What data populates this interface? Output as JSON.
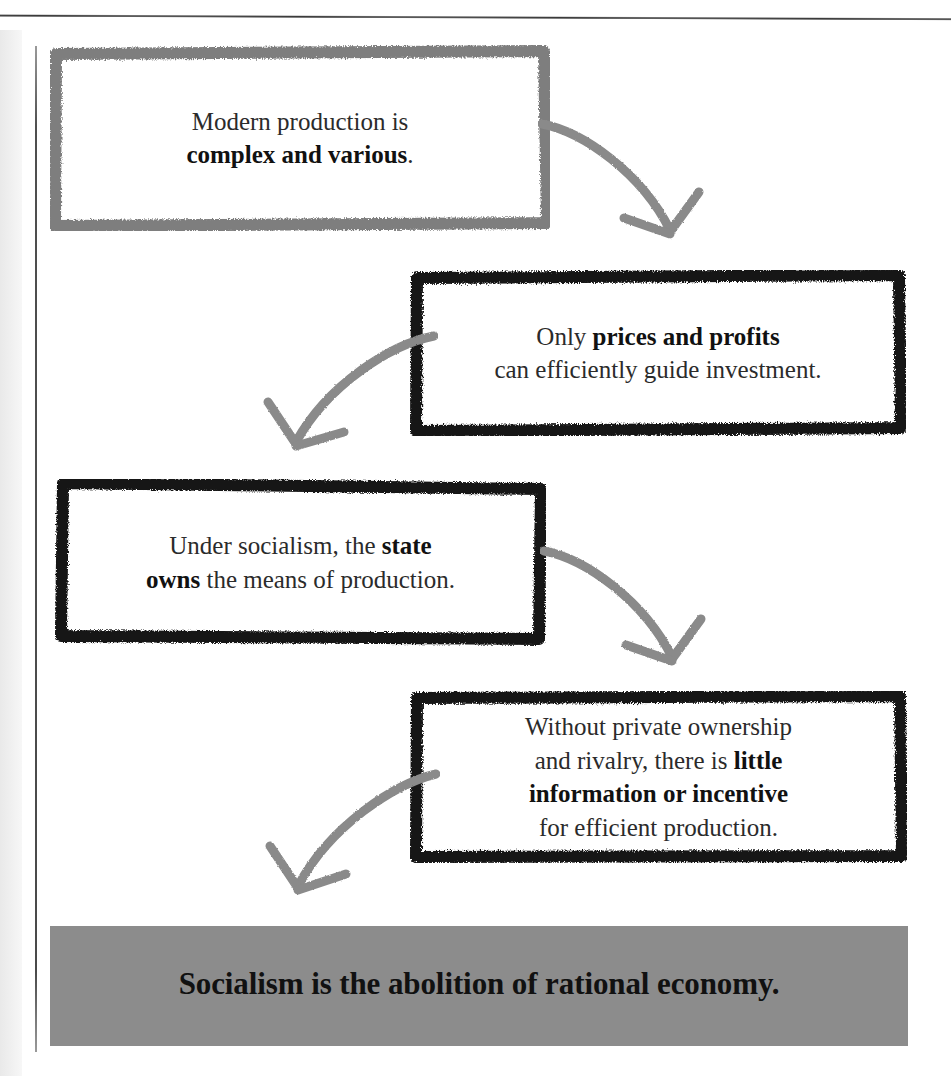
{
  "page": {
    "width": 951,
    "height": 1076,
    "background": "#ffffff",
    "artifacts": {
      "top_rule": "horizontal-rule",
      "left_rule": "vertical-rule",
      "page_gutter": "scan-gutter-shadow"
    }
  },
  "colors": {
    "box_1_border": "#808080",
    "box_2_border": "#141414",
    "box_3_border": "#141414",
    "box_4_border": "#141414",
    "arrow": "#8a8a8a",
    "banner_background": "#8c8c8c",
    "banner_text": "#111111",
    "body_text": "#2b2b2b"
  },
  "flow": {
    "type": "vertical-zigzag-flowchart",
    "nodes": [
      {
        "id": "node-1",
        "name": "modern-production",
        "border_style": "hand-drawn-gray",
        "lines": [
          {
            "text": "Modern production is",
            "bold": false
          },
          {
            "text": "complex and various",
            "bold": true,
            "suffix": "."
          }
        ],
        "plain_text": "Modern production is complex and various."
      },
      {
        "id": "node-2",
        "name": "prices-and-profits",
        "border_style": "hand-drawn-black",
        "lines": [
          {
            "text": "Only ",
            "bold": false,
            "bold_part": "prices and profits"
          },
          {
            "text": "can efficiently guide investment.",
            "bold": false
          }
        ],
        "plain_text": "Only prices and profits can efficiently guide investment."
      },
      {
        "id": "node-3",
        "name": "state-owns-means-of-production",
        "border_style": "hand-drawn-black",
        "lines": [
          {
            "text": "Under socialism, the ",
            "bold": false,
            "bold_part": "state"
          },
          {
            "text": " the means of production.",
            "bold": false,
            "bold_part": "owns"
          }
        ],
        "plain_text": "Under socialism, the state owns the means of production."
      },
      {
        "id": "node-4",
        "name": "no-information-or-incentive",
        "border_style": "hand-drawn-black",
        "lines": [
          {
            "text": "Without private ownership",
            "bold": false
          },
          {
            "text": "and rivalry, there is ",
            "bold": false,
            "bold_part": "little"
          },
          {
            "text": "information or incentive",
            "bold": true
          },
          {
            "text": "for efficient production.",
            "bold": false
          }
        ],
        "plain_text": "Without private ownership and rivalry, there is little information or incentive for efficient production."
      }
    ],
    "arrows": [
      {
        "id": "arrow-1",
        "name": "arrow-node1-to-node2",
        "from": "node-1",
        "to": "node-2",
        "direction": "down-right",
        "color": "#8a8a8a"
      },
      {
        "id": "arrow-2",
        "name": "arrow-node2-to-node3",
        "from": "node-2",
        "to": "node-3",
        "direction": "down-left",
        "color": "#8a8a8a"
      },
      {
        "id": "arrow-3",
        "name": "arrow-node3-to-node4",
        "from": "node-3",
        "to": "node-4",
        "direction": "down-right",
        "color": "#8a8a8a"
      },
      {
        "id": "arrow-4",
        "name": "arrow-node4-to-conclusion",
        "from": "node-4",
        "to": "conclusion",
        "direction": "down-left",
        "color": "#8a8a8a"
      }
    ],
    "conclusion": {
      "id": "conclusion",
      "name": "conclusion-banner",
      "text": "Socialism is the abolition of rational economy.",
      "background": "#8c8c8c",
      "emphasis": "bold"
    }
  },
  "nodes_text": {
    "n1_line1": "Modern production is",
    "n1_line2_bold": "complex and various",
    "n1_line2_tail": ".",
    "n2_line1_pre": "Only ",
    "n2_line1_bold": "prices and profits",
    "n2_line2": "can efficiently guide investment.",
    "n3_line1_pre": "Under socialism, the ",
    "n3_line1_bold": "state",
    "n3_line2_bold": "owns",
    "n3_line2_tail": " the means of production.",
    "n4_line1": "Without private ownership",
    "n4_line2_pre": "and rivalry, there is ",
    "n4_line2_bold": "little",
    "n4_line3_bold": "information or incentive",
    "n4_line4": "for efficient production.",
    "banner": "Socialism is the abolition of rational economy."
  }
}
